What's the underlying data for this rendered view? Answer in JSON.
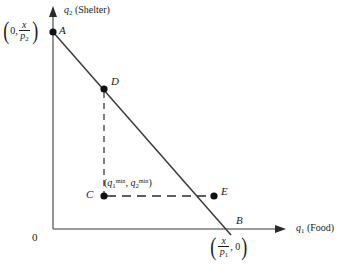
{
  "figure": {
    "type": "budget-constraint-diagram",
    "background_color": "#ffffff",
    "line_color": "#3a3a3a",
    "axis_color": "#7a7a7a",
    "text_color": "#1a1a1a"
  },
  "axes": {
    "y": {
      "symbol": "q",
      "subscript": "2",
      "name": "(Shelter)",
      "full_label": "q2 (Shelter)"
    },
    "x": {
      "symbol": "q",
      "subscript": "1",
      "name": "(Food)",
      "full_label": "q1 (Food)"
    },
    "origin_label": "0"
  },
  "points": {
    "A": {
      "label": "A",
      "coordinate_text": "(0, x/p2)",
      "coord_parts": {
        "left_paren": "(",
        "first": "0,",
        "numerator": "x",
        "denominator": "p",
        "denominator_sub": "2",
        "right_paren": ")"
      }
    },
    "B": {
      "label": "B",
      "coordinate_text": "(x/p1, 0)",
      "coord_parts": {
        "left_paren": "(",
        "numerator": "x",
        "denominator": "p",
        "denominator_sub": "1",
        "second": ", 0",
        "right_paren": ")"
      }
    },
    "C": {
      "label": "C",
      "coordinate_text": "(q1min, q2min)",
      "coord_parts": {
        "open": "(",
        "var1": "q",
        "sub1": "1",
        "sup1": "min",
        "comma": ", ",
        "var2": "q",
        "sub2": "2",
        "sup2": "min",
        "close": ")"
      }
    },
    "D": {
      "label": "D"
    },
    "E": {
      "label": "E"
    }
  },
  "lines": {
    "budget_line": "A to B",
    "vertical_dashed": "D to C",
    "horizontal_dashed": "C to E"
  }
}
